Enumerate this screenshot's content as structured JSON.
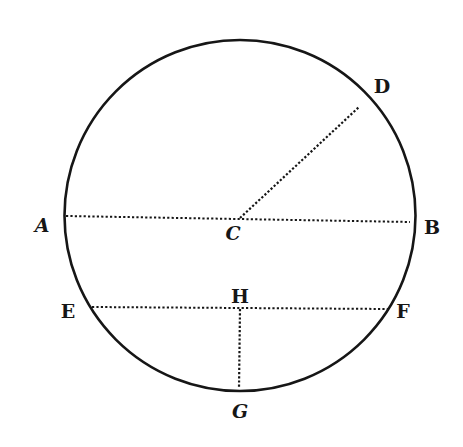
{
  "diagram": {
    "type": "geometry-circle",
    "colors": {
      "background": "#ffffff",
      "ink": "#161616"
    },
    "circle": {
      "cx": 240,
      "cy": 215.5,
      "r": 175.5
    },
    "segments": [
      {
        "name": "diameter-AB",
        "from": "A",
        "to": "B",
        "style": "dotted",
        "x1": 66,
        "y1": 216,
        "x2": 410,
        "y2": 222
      },
      {
        "name": "radius-CD",
        "from": "C",
        "to": "D",
        "style": "dotted",
        "x1": 240,
        "y1": 218,
        "x2": 359,
        "y2": 107
      },
      {
        "name": "chord-EF",
        "from": "E",
        "to": "F",
        "style": "dotted",
        "x1": 92,
        "y1": 307,
        "x2": 389,
        "y2": 309
      },
      {
        "name": "segment-HG",
        "from": "H",
        "to": "G",
        "style": "dotted",
        "x1": 240,
        "y1": 309,
        "x2": 239,
        "y2": 388
      }
    ],
    "points": {
      "A": {
        "label": "A",
        "x": 42,
        "y": 232
      },
      "B": {
        "label": "B",
        "x": 432,
        "y": 234
      },
      "C": {
        "label": "C",
        "x": 233,
        "y": 240
      },
      "D": {
        "label": "D",
        "x": 382,
        "y": 93
      },
      "E": {
        "label": "E",
        "x": 68,
        "y": 318
      },
      "F": {
        "label": "F",
        "x": 403,
        "y": 318
      },
      "G": {
        "label": "G",
        "x": 240,
        "y": 418
      },
      "H": {
        "label": "H",
        "x": 240,
        "y": 303
      }
    }
  }
}
